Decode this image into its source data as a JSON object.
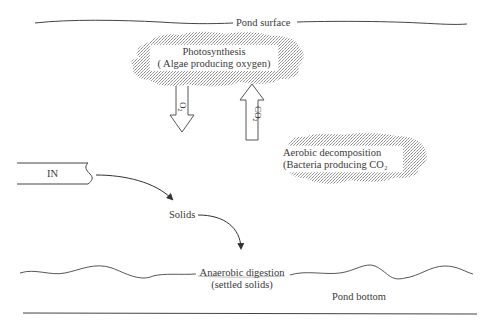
{
  "diagram": {
    "type": "pond process diagram",
    "labels": {
      "pond_surface": "Pond surface",
      "photosynthesis_title": "Photosynthesis",
      "photosynthesis_sub": "( Algae producing oxygen)",
      "o2_arrow": "O₂",
      "co2_arrow": "CO₂",
      "aerobic_title": "Aerobic decomposition",
      "aerobic_sub": "(Bacteria producing CO₂",
      "inlet": "IN",
      "solids": "Solids",
      "anaerobic_title": "Anaerobic digestion",
      "anaerobic_sub": "(settled solids)",
      "pond_bottom": "Pond bottom"
    },
    "nodes": [
      {
        "id": "photosynthesis",
        "shape": "stippled-cloud"
      },
      {
        "id": "aerobic",
        "shape": "stippled-cloud"
      },
      {
        "id": "inlet",
        "shape": "pipe"
      },
      {
        "id": "solids",
        "shape": "text"
      },
      {
        "id": "anaerobic",
        "shape": "wavy-line-label"
      }
    ],
    "edges": [
      {
        "from": "photosynthesis",
        "to": "pond",
        "label": "O₂",
        "style": "hollow-arrow-down"
      },
      {
        "from": "pond",
        "to": "photosynthesis",
        "label": "CO₂",
        "style": "hollow-arrow-up"
      },
      {
        "from": "inlet",
        "to": "solids",
        "style": "curved-arrow"
      },
      {
        "from": "solids",
        "to": "anaerobic",
        "style": "curved-arrow"
      }
    ],
    "colors": {
      "line": "#444444",
      "stipple": "#9a9a9a",
      "background": "#ffffff"
    }
  }
}
